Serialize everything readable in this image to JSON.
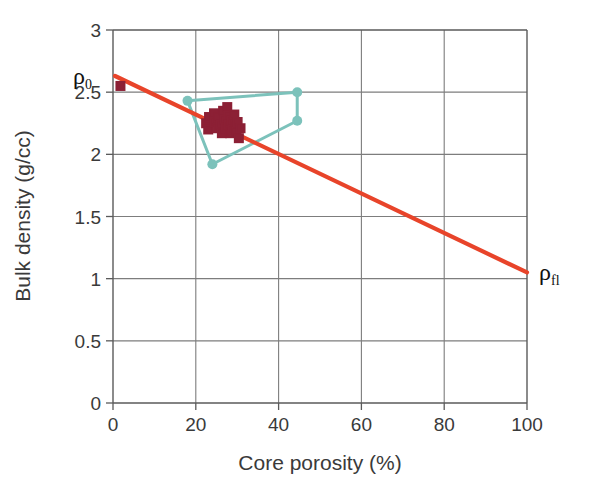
{
  "chart_data": {
    "type": "scatter",
    "title": "",
    "xlabel": "Core porosity (%)",
    "ylabel": "Bulk density (g/cc)",
    "xlim": [
      0,
      100
    ],
    "ylim": [
      0,
      3
    ],
    "xticks": [
      0,
      20,
      40,
      60,
      80,
      100
    ],
    "yticks": [
      0,
      0.5,
      1,
      1.5,
      2,
      2.5,
      3
    ],
    "xtick_labels": [
      "0",
      "20",
      "40",
      "60",
      "80",
      "100"
    ],
    "ytick_labels": [
      "0",
      "0.5",
      "1",
      "1.5",
      "2",
      "2.5",
      "3"
    ],
    "grid": true,
    "legend": "none",
    "series": [
      {
        "name": "core-plug-measurements",
        "type": "scatter",
        "marker": "open-square",
        "color": "#8c2035",
        "points": [
          {
            "x": 1.8,
            "y": 2.55
          },
          {
            "x": 22.5,
            "y": 2.25
          },
          {
            "x": 23.2,
            "y": 2.3
          },
          {
            "x": 23.0,
            "y": 2.2
          },
          {
            "x": 24.4,
            "y": 2.33
          },
          {
            "x": 24.6,
            "y": 2.26
          },
          {
            "x": 25.2,
            "y": 2.21
          },
          {
            "x": 25.4,
            "y": 2.3
          },
          {
            "x": 26.0,
            "y": 2.24
          },
          {
            "x": 26.3,
            "y": 2.17
          },
          {
            "x": 26.6,
            "y": 2.35
          },
          {
            "x": 27.0,
            "y": 2.28
          },
          {
            "x": 27.2,
            "y": 2.21
          },
          {
            "x": 27.6,
            "y": 2.38
          },
          {
            "x": 27.9,
            "y": 2.31
          },
          {
            "x": 28.0,
            "y": 2.24
          },
          {
            "x": 28.3,
            "y": 2.17
          },
          {
            "x": 28.6,
            "y": 2.27
          },
          {
            "x": 28.9,
            "y": 2.2
          },
          {
            "x": 29.3,
            "y": 2.32
          },
          {
            "x": 29.5,
            "y": 2.24
          },
          {
            "x": 29.8,
            "y": 2.18
          },
          {
            "x": 30.1,
            "y": 2.26
          },
          {
            "x": 30.4,
            "y": 2.13
          },
          {
            "x": 30.8,
            "y": 2.21
          }
        ]
      },
      {
        "name": "log-response-loop",
        "type": "line",
        "marker": "filled-circle",
        "color": "#7cc2bb",
        "closed": true,
        "points": [
          {
            "x": 18.0,
            "y": 2.43
          },
          {
            "x": 44.5,
            "y": 2.5
          },
          {
            "x": 44.5,
            "y": 2.27
          },
          {
            "x": 24.0,
            "y": 1.92
          }
        ]
      },
      {
        "name": "density-porosity-trend",
        "type": "line",
        "marker": "none",
        "color": "#e8442a",
        "points": [
          {
            "x": 0.5,
            "y": 2.63
          },
          {
            "x": 100,
            "y": 1.05
          }
        ]
      }
    ],
    "annotations": [
      {
        "name": "matrix-density-label",
        "text": "ρ",
        "subscript": "0",
        "x": 0,
        "y": 2.63,
        "position": "left-of-axis"
      },
      {
        "name": "fluid-density-label",
        "text": "ρ",
        "subscript": "fl",
        "x": 100,
        "y": 1.05,
        "position": "right-of-axis"
      }
    ],
    "colors": {
      "trend": "#e8442a",
      "loop": "#7cc2bb",
      "markers": "#8c2035",
      "axis": "#5a5a5a",
      "grid": "#7d7d7d",
      "text": "#3a3a3a",
      "background": "#ffffff"
    }
  }
}
